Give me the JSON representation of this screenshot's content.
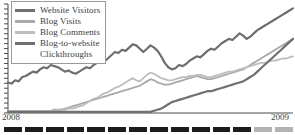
{
  "chart_data": {
    "type": "line",
    "title": "",
    "subtitle": "",
    "xlabel": "",
    "ylabel": "",
    "grid": false,
    "legend_position": "top-left",
    "x_tick_labels": [
      "2008",
      "2009"
    ],
    "x": [
      0,
      1,
      2,
      3,
      4,
      5,
      6,
      7,
      8,
      9,
      10,
      11,
      12,
      13,
      14,
      15,
      16,
      17,
      18,
      19,
      20,
      21,
      22,
      23,
      24,
      25,
      26,
      27,
      28,
      29,
      30,
      31,
      32,
      33,
      34,
      35,
      36,
      37,
      38,
      39,
      40,
      41,
      42,
      43,
      44,
      45,
      46,
      47,
      48,
      49,
      50,
      51,
      52,
      53,
      54,
      55,
      56,
      57,
      58,
      59,
      60,
      61,
      62,
      63,
      64,
      65,
      66,
      67,
      68,
      69,
      70,
      71,
      72,
      73,
      74,
      75,
      76,
      77,
      78,
      79,
      80
    ],
    "ylim": [
      0,
      100
    ],
    "xlim": [
      0,
      80
    ],
    "series": [
      {
        "name": "Website Visitors",
        "color": "#6e6e6e",
        "width": 2.2,
        "values": [
          28,
          27,
          30,
          29,
          33,
          34,
          36,
          38,
          37,
          40,
          42,
          41,
          44,
          43,
          42,
          40,
          38,
          39,
          37,
          36,
          38,
          40,
          42,
          41,
          44,
          46,
          48,
          47,
          50,
          53,
          56,
          55,
          58,
          57,
          60,
          63,
          62,
          59,
          56,
          59,
          62,
          60,
          57,
          52,
          46,
          42,
          40,
          41,
          44,
          43,
          45,
          48,
          50,
          52,
          51,
          54,
          57,
          59,
          58,
          61,
          64,
          66,
          68,
          67,
          70,
          73,
          71,
          68,
          70,
          73,
          76,
          78,
          80,
          82,
          84,
          86,
          88,
          90,
          92,
          94,
          96
        ]
      },
      {
        "name": "Blog Visits",
        "color": "#a9a9a9",
        "width": 1.8,
        "values": [
          2,
          2,
          2,
          2,
          2,
          2,
          2,
          2,
          2,
          2,
          2,
          2,
          2,
          3,
          3,
          3,
          4,
          5,
          6,
          7,
          8,
          9,
          10,
          11,
          12,
          13,
          14,
          15,
          16,
          17,
          18,
          19,
          20,
          21,
          22,
          23,
          24,
          25,
          27,
          29,
          31,
          30,
          28,
          27,
          26,
          26,
          27,
          28,
          29,
          30,
          31,
          32,
          33,
          34,
          33,
          32,
          31,
          31,
          32,
          33,
          34,
          35,
          36,
          37,
          38,
          39,
          40,
          42,
          44,
          46,
          48,
          50,
          52,
          54,
          56,
          58,
          60,
          62,
          64,
          66,
          68
        ]
      },
      {
        "name": "Blog Comments",
        "color": "#bdbdbd",
        "width": 1.8,
        "values": [
          2,
          2,
          2,
          2,
          2,
          2,
          2,
          2,
          2,
          2,
          2,
          2,
          2,
          2,
          3,
          3,
          3,
          4,
          4,
          5,
          6,
          7,
          9,
          11,
          13,
          14,
          16,
          18,
          19,
          21,
          23,
          24,
          26,
          28,
          30,
          32,
          30,
          29,
          32,
          35,
          37,
          36,
          34,
          32,
          31,
          30,
          30,
          31,
          32,
          33,
          33,
          34,
          34,
          35,
          35,
          34,
          33,
          33,
          34,
          35,
          36,
          37,
          38,
          38,
          39,
          40,
          41,
          42,
          43,
          44,
          45,
          46,
          46,
          47,
          48,
          48,
          49,
          50,
          50,
          51,
          52
        ]
      },
      {
        "name": "Blog-to-website Clickthroughs",
        "color": "#707070",
        "width": 2.2,
        "values": [
          1,
          1,
          1,
          1,
          1,
          1,
          1,
          1,
          1,
          1,
          1,
          1,
          1,
          1,
          1,
          1,
          1,
          1,
          1,
          1,
          1,
          1,
          1,
          1,
          1,
          1,
          1,
          1,
          1,
          1,
          1,
          1,
          1,
          1,
          1,
          1,
          1,
          1,
          1,
          1,
          1,
          2,
          3,
          4,
          6,
          8,
          10,
          11,
          12,
          13,
          14,
          15,
          16,
          17,
          18,
          19,
          20,
          20,
          21,
          22,
          23,
          24,
          25,
          26,
          27,
          28,
          29,
          31,
          33,
          35,
          38,
          41,
          44,
          47,
          50,
          53,
          56,
          59,
          62,
          65,
          68
        ]
      }
    ]
  },
  "legend": {
    "items": [
      {
        "label": "Website Visitors",
        "label2": "",
        "color": "#6e6e6e"
      },
      {
        "label": "Blog Visits",
        "label2": "",
        "color": "#a9a9a9"
      },
      {
        "label": "Blog Comments",
        "label2": "",
        "color": "#bdbdbd"
      },
      {
        "label": "Blog-to-website",
        "label2": "Clickthroughs",
        "color": "#707070"
      }
    ]
  },
  "axis": {
    "year_left": "2008",
    "year_right": "2009",
    "axis_color": "#4a4a4a",
    "tick_count": 22
  },
  "tick_strip": {
    "dash_count": 14,
    "muted_from_index": 12,
    "dark_color": "#1c1c1c",
    "muted_color": "#b3b3b3"
  }
}
